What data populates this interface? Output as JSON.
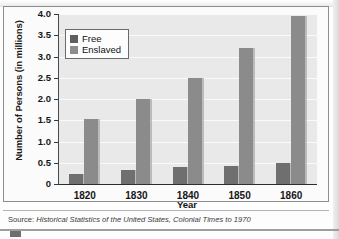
{
  "chart_data": {
    "type": "bar",
    "title": "",
    "xlabel": "Year",
    "ylabel": "Number of Persons (in millions)",
    "categories": [
      "1820",
      "1830",
      "1840",
      "1850",
      "1860"
    ],
    "series": [
      {
        "name": "Free",
        "values": [
          0.23,
          0.32,
          0.39,
          0.43,
          0.49
        ],
        "color": "#6f6f6f"
      },
      {
        "name": "Enslaved",
        "values": [
          1.54,
          2.01,
          2.49,
          3.2,
          3.95
        ],
        "color": "#8b8b8b"
      }
    ],
    "ylim": [
      0,
      4.0
    ],
    "ytick_labels": [
      "4.0",
      "3.5",
      "3.0",
      "2.5",
      "2.0",
      "1.5",
      "1.0",
      "0.5",
      "0"
    ],
    "ytick_values": [
      4.0,
      3.5,
      3.0,
      2.5,
      2.0,
      1.5,
      1.0,
      0.5,
      0
    ],
    "grid": true,
    "legend_position": "top-left",
    "plot_background": "#e9e9e9",
    "gridline_color": "#fafafa"
  },
  "legend": {
    "items": [
      {
        "label": "Free"
      },
      {
        "label": "Enslaved"
      }
    ]
  },
  "source": {
    "lead": "Source:",
    "text": " Historical Statistics of the United States, Colonial Times to 1970"
  }
}
